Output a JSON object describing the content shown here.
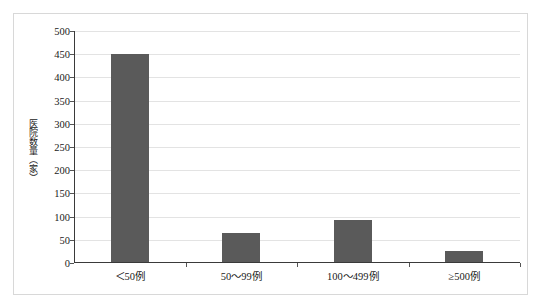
{
  "chart_data": {
    "type": "bar",
    "title": "",
    "subtitle": "",
    "xlabel": "",
    "ylabel": "医院数量（家）",
    "categories": [
      "＜50例",
      "50～99例",
      "100～499例",
      "≥500例"
    ],
    "values": [
      450,
      65,
      92,
      25
    ],
    "series": [
      {
        "name": "医院数量（家）",
        "values": [
          450,
          65,
          92,
          25
        ]
      }
    ],
    "ylim": [
      0,
      500
    ],
    "ytick_interval": 50,
    "y_ticks": [
      0,
      50,
      100,
      150,
      200,
      250,
      300,
      350,
      400,
      450,
      500
    ],
    "y_tick_labels": [
      "0",
      "50",
      "100",
      "150",
      "200",
      "250",
      "300",
      "350",
      "400",
      "450",
      "500"
    ],
    "grid": true,
    "grid_axis": "y",
    "legend": false,
    "legend_position": "none",
    "bar_color": "#5a5a5a",
    "gridline_color": "#e3e3e3",
    "axis_color": "#3a3a3a",
    "frame_color": "#d8d8d8",
    "background_color": "#ffffff",
    "annotations": []
  }
}
